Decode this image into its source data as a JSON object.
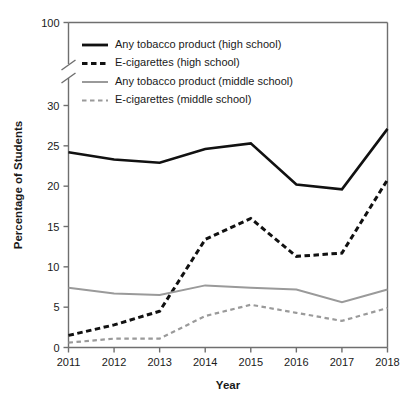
{
  "chart_data": {
    "type": "line",
    "title": "",
    "xlabel": "Year",
    "ylabel": "Percentage of Students",
    "categories": [
      "2011",
      "2012",
      "2013",
      "2014",
      "2015",
      "2016",
      "2017",
      "2018"
    ],
    "x": [
      2011,
      2012,
      2013,
      2014,
      2015,
      2016,
      2017,
      2018
    ],
    "ylim": [
      0,
      100
    ],
    "y_ticks": [
      "0",
      "5",
      "10",
      "15",
      "20",
      "25",
      "30",
      "100"
    ],
    "y_axis_break": true,
    "y_axis_break_between": [
      30,
      100
    ],
    "grid": false,
    "legend_position": "top-left inside plot",
    "series": [
      {
        "name": "Any tobacco product (high school)",
        "style": "solid",
        "color": "#111111",
        "values": [
          24.2,
          23.3,
          22.9,
          24.6,
          25.3,
          20.2,
          19.6,
          27.1
        ]
      },
      {
        "name": "E-cigarettes (high school)",
        "style": "dashed",
        "color": "#111111",
        "values": [
          1.5,
          2.8,
          4.5,
          13.4,
          16.0,
          11.3,
          11.7,
          20.8
        ]
      },
      {
        "name": "Any tobacco product (middle school)",
        "style": "solid",
        "color": "#9a9a9a",
        "values": [
          7.4,
          6.7,
          6.5,
          7.7,
          7.4,
          7.2,
          5.6,
          7.2
        ]
      },
      {
        "name": "E-cigarettes (middle school)",
        "style": "dashed",
        "color": "#9a9a9a",
        "values": [
          0.6,
          1.1,
          1.1,
          3.9,
          5.3,
          4.3,
          3.3,
          4.9
        ]
      }
    ]
  },
  "colors": {
    "high_school": "#111111",
    "middle_school": "#9a9a9a",
    "axis": "#6f6f6f",
    "background": "#ffffff"
  }
}
